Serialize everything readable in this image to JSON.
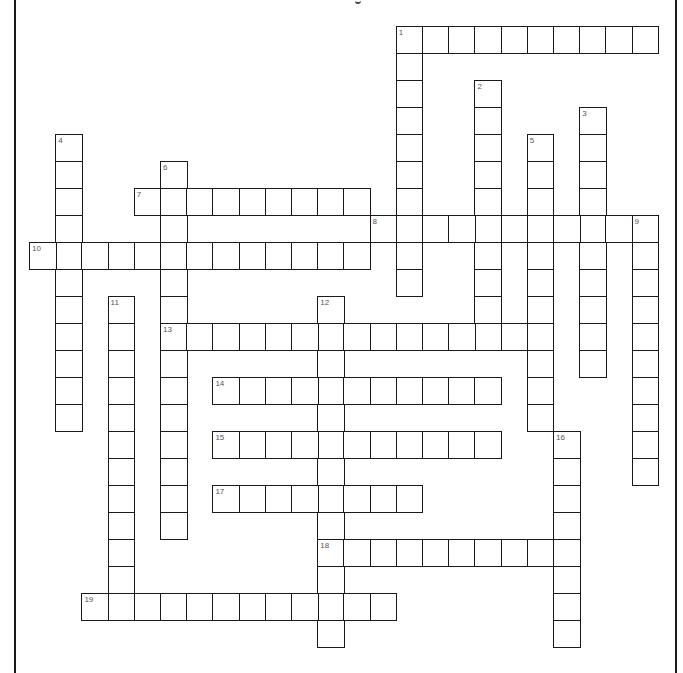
{
  "puzzle": {
    "type": "crossword",
    "grid": {
      "origin_x": 29,
      "origin_y": 26,
      "cell_w": 26.2,
      "cell_h": 27
    },
    "colors": {
      "border": "#1a1a1a",
      "number": "#555555",
      "background": "#ffffff"
    },
    "entries": [
      {
        "number": "1",
        "direction": "across",
        "row": 0,
        "col": 14,
        "length": 10
      },
      {
        "number": "1",
        "direction": "down",
        "row": 0,
        "col": 14,
        "length": 10
      },
      {
        "number": "2",
        "direction": "down",
        "row": 2,
        "col": 17,
        "length": 10
      },
      {
        "number": "3",
        "direction": "down",
        "row": 3,
        "col": 21,
        "length": 10
      },
      {
        "number": "4",
        "direction": "down",
        "row": 4,
        "col": 1,
        "length": 11
      },
      {
        "number": "5",
        "direction": "down",
        "row": 4,
        "col": 19,
        "length": 11
      },
      {
        "number": "6",
        "direction": "down",
        "row": 5,
        "col": 5,
        "length": 14
      },
      {
        "number": "7",
        "direction": "across",
        "row": 6,
        "col": 4,
        "length": 9
      },
      {
        "number": "8",
        "direction": "across",
        "row": 7,
        "col": 13,
        "length": 11
      },
      {
        "number": "9",
        "direction": "down",
        "row": 7,
        "col": 23,
        "length": 10
      },
      {
        "number": "10",
        "direction": "across",
        "row": 8,
        "col": 0,
        "length": 13
      },
      {
        "number": "11",
        "direction": "down",
        "row": 10,
        "col": 3,
        "length": 12
      },
      {
        "number": "12",
        "direction": "down",
        "row": 10,
        "col": 11,
        "length": 13
      },
      {
        "number": "13",
        "direction": "across",
        "row": 11,
        "col": 5,
        "length": 15
      },
      {
        "number": "14",
        "direction": "across",
        "row": 13,
        "col": 7,
        "length": 11
      },
      {
        "number": "15",
        "direction": "across",
        "row": 15,
        "col": 7,
        "length": 11
      },
      {
        "number": "16",
        "direction": "down",
        "row": 15,
        "col": 20,
        "length": 8
      },
      {
        "number": "17",
        "direction": "across",
        "row": 17,
        "col": 7,
        "length": 8
      },
      {
        "number": "18",
        "direction": "across",
        "row": 19,
        "col": 11,
        "length": 10
      },
      {
        "number": "19",
        "direction": "across",
        "row": 21,
        "col": 2,
        "length": 12
      }
    ]
  }
}
